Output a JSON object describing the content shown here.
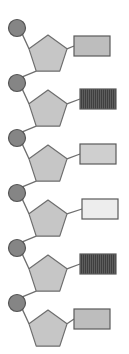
{
  "figure": {
    "width": 354,
    "height": 354,
    "canvas_width": 129,
    "background_color": "#ffffff"
  },
  "style": {
    "phosphate_fill": "#858585",
    "phosphate_stroke": "#555555",
    "sugar_fill": "#c6c6c6",
    "sugar_stroke": "#6e6e6e",
    "bond_color": "#6e6e6e",
    "base_stroke": "#5a5a5a",
    "bond_width": 1.3,
    "shape_stroke_width": 1.2,
    "phosphate_radius": 8.5,
    "sugar_radius": 20,
    "base_width": 36,
    "base_height": 20
  },
  "legend": {
    "phosphate_name": "phosphate-circle",
    "sugar_name": "sugar-pentagon",
    "base_name": "base-rectangle",
    "bond_name": "bond-line"
  },
  "chart_data": {
    "type": "diagram",
    "unit_count": 6,
    "repeat_spacing_px": 55,
    "units": [
      {
        "index": 1,
        "phosphate": {
          "cx": 17,
          "cy": 28,
          "fill": "#858585",
          "label": "phosphate"
        },
        "sugar": {
          "cx": 48,
          "cy": 55,
          "fill": "#c6c6c6",
          "label": "sugar"
        },
        "base": {
          "x": 74,
          "y": 36,
          "fill": "#bdbdbd",
          "pattern": "solid",
          "label": "base-light-gray"
        }
      },
      {
        "index": 2,
        "phosphate": {
          "cx": 17,
          "cy": 83,
          "fill": "#858585",
          "label": "phosphate"
        },
        "sugar": {
          "cx": 48,
          "cy": 110,
          "fill": "#c6c6c6",
          "label": "sugar"
        },
        "base": {
          "x": 80,
          "y": 89,
          "fill": "#4a4a4a",
          "pattern": "vertical-hatch",
          "label": "base-dark-hatched"
        }
      },
      {
        "index": 3,
        "phosphate": {
          "cx": 17,
          "cy": 138,
          "fill": "#858585",
          "label": "phosphate"
        },
        "sugar": {
          "cx": 48,
          "cy": 165,
          "fill": "#c6c6c6",
          "label": "sugar"
        },
        "base": {
          "x": 80,
          "y": 144,
          "fill": "#cfcfcf",
          "pattern": "solid",
          "label": "base-light-gray"
        }
      },
      {
        "index": 4,
        "phosphate": {
          "cx": 17,
          "cy": 193,
          "fill": "#858585",
          "label": "phosphate"
        },
        "sugar": {
          "cx": 48,
          "cy": 220,
          "fill": "#c6c6c6",
          "label": "sugar"
        },
        "base": {
          "x": 82,
          "y": 199,
          "fill": "#ededed",
          "pattern": "solid",
          "label": "base-near-white"
        }
      },
      {
        "index": 5,
        "phosphate": {
          "cx": 17,
          "cy": 248,
          "fill": "#858585",
          "label": "phosphate"
        },
        "sugar": {
          "cx": 48,
          "cy": 275,
          "fill": "#c6c6c6",
          "label": "sugar"
        },
        "base": {
          "x": 80,
          "y": 254,
          "fill": "#4a4a4a",
          "pattern": "vertical-hatch",
          "label": "base-dark-hatched"
        }
      },
      {
        "index": 6,
        "phosphate": {
          "cx": 17,
          "cy": 303,
          "fill": "#858585",
          "label": "phosphate"
        },
        "sugar": {
          "cx": 48,
          "cy": 330,
          "fill": "#c6c6c6",
          "label": "sugar"
        },
        "base": {
          "x": 74,
          "y": 309,
          "fill": "#bdbdbd",
          "pattern": "solid",
          "label": "base-light-gray"
        }
      }
    ]
  }
}
